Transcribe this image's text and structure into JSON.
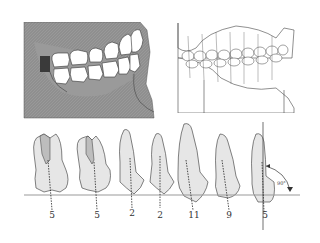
{
  "figure": {
    "top_left": {
      "description": "Lateral view of skull with teeth in occlusion",
      "fill": "#8c8c8c"
    },
    "top_right": {
      "description": "Line drawing of dental cast in occlusion with long axes of teeth"
    },
    "bottom": {
      "description": "Mesiodistal angulation of teeth relative to occlusal plane",
      "occlusal_line_color": "#999999",
      "tooth_fill": "#e6e6e6",
      "teeth": [
        {
          "label": "5",
          "x": 52
        },
        {
          "label": "5",
          "x": 97
        },
        {
          "label": "2",
          "x": 132
        },
        {
          "label": "2",
          "x": 159
        },
        {
          "label": "11",
          "x": 193
        },
        {
          "label": "9",
          "x": 229
        },
        {
          "label": "5",
          "x": 265
        }
      ],
      "angle_label": "90°"
    }
  }
}
